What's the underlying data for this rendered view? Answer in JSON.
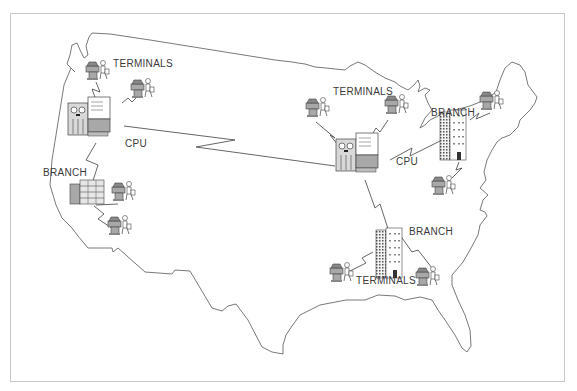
{
  "diagram": {
    "title": "",
    "type": "network-map",
    "background_map": "united-states-outline",
    "colors": {
      "line": "#555555",
      "outline": "#6a6a6a",
      "equipment_fill": "#a8a8a8",
      "frame": "#c8c8c8",
      "text": "#3a3a3a"
    }
  },
  "labels": {
    "west_terminals": "TERMINALS",
    "west_cpu": "CPU",
    "west_branch": "BRANCH",
    "east_terminals": "TERMINALS",
    "east_cpu": "CPU",
    "northeast_branch": "BRANCH",
    "southeast_branch": "BRANCH",
    "southeast_terminals": "TERMINALS"
  },
  "nodes": [
    {
      "id": "west-cpu",
      "kind": "cpu",
      "label": "CPU"
    },
    {
      "id": "west-terminal-1",
      "kind": "terminal"
    },
    {
      "id": "west-terminal-2",
      "kind": "terminal"
    },
    {
      "id": "west-branch",
      "kind": "branch",
      "label": "BRANCH"
    },
    {
      "id": "west-branch-terminal-1",
      "kind": "terminal"
    },
    {
      "id": "west-branch-terminal-2",
      "kind": "terminal"
    },
    {
      "id": "east-cpu",
      "kind": "cpu",
      "label": "CPU"
    },
    {
      "id": "east-terminal-1",
      "kind": "terminal"
    },
    {
      "id": "east-terminal-2",
      "kind": "terminal"
    },
    {
      "id": "northeast-branch",
      "kind": "branch",
      "label": "BRANCH"
    },
    {
      "id": "northeast-terminal-1",
      "kind": "terminal"
    },
    {
      "id": "northeast-terminal-2",
      "kind": "terminal"
    },
    {
      "id": "southeast-branch",
      "kind": "branch",
      "label": "BRANCH"
    },
    {
      "id": "southeast-terminal-1",
      "kind": "terminal"
    },
    {
      "id": "southeast-terminal-2",
      "kind": "terminal"
    }
  ],
  "links": [
    [
      "west-cpu",
      "east-cpu"
    ],
    [
      "west-cpu",
      "west-terminal-1"
    ],
    [
      "west-cpu",
      "west-terminal-2"
    ],
    [
      "west-cpu",
      "west-branch"
    ],
    [
      "west-branch",
      "west-branch-terminal-1"
    ],
    [
      "west-branch",
      "west-branch-terminal-2"
    ],
    [
      "east-cpu",
      "east-terminal-1"
    ],
    [
      "east-cpu",
      "east-terminal-2"
    ],
    [
      "east-cpu",
      "northeast-branch"
    ],
    [
      "northeast-branch",
      "northeast-terminal-1"
    ],
    [
      "northeast-branch",
      "northeast-terminal-2"
    ],
    [
      "east-cpu",
      "southeast-branch"
    ],
    [
      "southeast-branch",
      "southeast-terminal-1"
    ],
    [
      "southeast-branch",
      "southeast-terminal-2"
    ]
  ]
}
